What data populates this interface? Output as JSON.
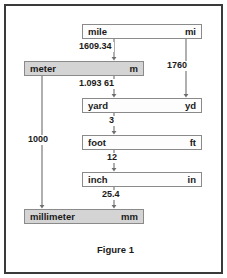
{
  "figure": {
    "caption": "Figure 1",
    "border_color": "#3a3a3a",
    "background_color": "#ffffff"
  },
  "style": {
    "metric_fill": "#d4d4d4",
    "imperial_fill": "#fdfdfd",
    "box_border": "#8a8a8a",
    "arrow_color": "#6e6e6e",
    "text_color": "#1a1a1a"
  },
  "units": [
    {
      "id": "mile",
      "name": "mile",
      "symbol": "mi",
      "system": "imperial"
    },
    {
      "id": "meter",
      "name": "meter",
      "symbol": "m",
      "system": "metric"
    },
    {
      "id": "yard",
      "name": "yard",
      "symbol": "yd",
      "system": "imperial"
    },
    {
      "id": "foot",
      "name": "foot",
      "symbol": "ft",
      "system": "imperial"
    },
    {
      "id": "inch",
      "name": "inch",
      "symbol": "in",
      "system": "imperial"
    },
    {
      "id": "millimeter",
      "name": "millimeter",
      "symbol": "mm",
      "system": "metric"
    }
  ],
  "conversions": [
    {
      "id": "mile-to-meter",
      "from": "mile",
      "to": "meter",
      "factor": "1609.34"
    },
    {
      "id": "meter-to-yard",
      "from": "meter",
      "to": "yard",
      "factor": "1.093 61"
    },
    {
      "id": "mile-to-yard",
      "from": "mile",
      "to": "yard",
      "factor": "1760"
    },
    {
      "id": "yard-to-foot",
      "from": "yard",
      "to": "foot",
      "factor": "3"
    },
    {
      "id": "foot-to-inch",
      "from": "foot",
      "to": "inch",
      "factor": "12"
    },
    {
      "id": "inch-to-millimeter",
      "from": "inch",
      "to": "millimeter",
      "factor": "25.4"
    },
    {
      "id": "meter-to-millimeter",
      "from": "meter",
      "to": "millimeter",
      "factor": "1000"
    }
  ]
}
